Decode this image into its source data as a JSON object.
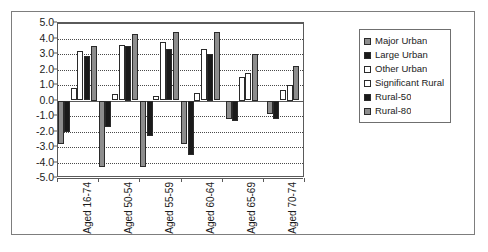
{
  "chart_data": {
    "type": "bar",
    "title": "",
    "subtitle": "",
    "xlabel": "",
    "ylabel": "",
    "ylim": [
      -5.0,
      5.0
    ],
    "ytick_step": 1.0,
    "ytick_labels": [
      "5.0",
      "4.0",
      "3.0",
      "2.0",
      "1.0",
      "0.0",
      "-1.0",
      "-2.0",
      "-3.0",
      "-4.0",
      "-5.0"
    ],
    "ytick_values": [
      5.0,
      4.0,
      3.0,
      2.0,
      1.0,
      0.0,
      -1.0,
      -2.0,
      -3.0,
      -4.0,
      -5.0
    ],
    "grid": true,
    "grid_style": "dotted-horizontal",
    "legend_position": "right",
    "categories": [
      "Aged 16-74",
      "Aged 50-54",
      "Aged 55-59",
      "Aged 60-64",
      "Aged 65-69",
      "Aged 70-74"
    ],
    "series": [
      {
        "name": "Major Urban",
        "color": "#8d8d8d",
        "values": [
          -2.8,
          -4.3,
          -4.3,
          -2.8,
          -1.2,
          -0.9
        ]
      },
      {
        "name": "Large Urban",
        "color": "#1a1a1a",
        "values": [
          -2.0,
          -1.7,
          -2.3,
          -3.5,
          -1.3,
          -1.2
        ]
      },
      {
        "name": "Other Urban",
        "color": "#ffffff",
        "values": [
          0.8,
          0.4,
          0.3,
          0.5,
          1.5,
          0.7
        ]
      },
      {
        "name": "Significant Rural",
        "color": "#ffffff",
        "values": [
          3.2,
          3.6,
          3.8,
          3.3,
          1.8,
          1.0
        ]
      },
      {
        "name": "Rural-50",
        "color": "#1a1a1a",
        "values": [
          2.9,
          3.5,
          3.3,
          3.0,
          null,
          null
        ]
      },
      {
        "name": "Rural-80",
        "color": "#8d8d8d",
        "values": [
          3.5,
          4.3,
          4.4,
          4.4,
          3.0,
          2.2
        ]
      }
    ]
  },
  "legend": {
    "items": [
      {
        "label": "Major Urban",
        "swatch": "fill-major"
      },
      {
        "label": "Large Urban",
        "swatch": "fill-large"
      },
      {
        "label": "Other Urban",
        "swatch": "fill-other"
      },
      {
        "label": "Significant Rural",
        "swatch": "fill-sigrur"
      },
      {
        "label": "Rural-50",
        "swatch": "fill-r50"
      },
      {
        "label": "Rural-80",
        "swatch": "fill-r80"
      }
    ]
  }
}
